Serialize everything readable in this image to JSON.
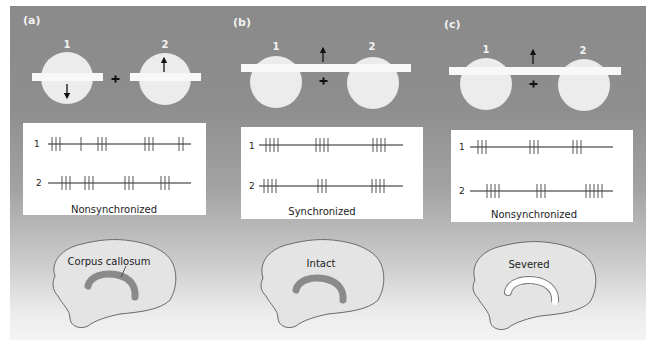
{
  "panels": [
    {
      "letter": "(a)",
      "stimulus": {
        "cell_labels": [
          "1",
          "2"
        ],
        "bar_type": "two separate bars",
        "arrow_1": "down",
        "arrow_2": "up",
        "arrow_center": null
      },
      "spike_trains": {
        "row_labels": [
          "1",
          "2"
        ],
        "caption": "Nonsynchronized"
      },
      "brain": {
        "label": "Corpus callosum",
        "state": "normal"
      }
    },
    {
      "letter": "(b)",
      "stimulus": {
        "cell_labels": [
          "1",
          "2"
        ],
        "bar_type": "single long bar",
        "arrow_center": "up"
      },
      "spike_trains": {
        "row_labels": [
          "1",
          "2"
        ],
        "caption": "Synchronized"
      },
      "brain": {
        "label": "Intact",
        "state": "intact"
      }
    },
    {
      "letter": "(c)",
      "stimulus": {
        "cell_labels": [
          "1",
          "2"
        ],
        "bar_type": "single long bar",
        "arrow_center": "up"
      },
      "spike_trains": {
        "row_labels": [
          "1",
          "2"
        ],
        "caption": "Nonsynchronized"
      },
      "brain": {
        "label": "Severed",
        "state": "severed"
      }
    }
  ],
  "colors": {
    "background_top": "#8a8a8a",
    "background_bottom": "#f4f4f4",
    "circle_fill": "#ececec",
    "bar_fill": "#f8f8f8",
    "corpus_callosum": "#8a8a8a",
    "brain_fill": "#e4e4e4",
    "brain_outline": "#6a6a6a"
  }
}
